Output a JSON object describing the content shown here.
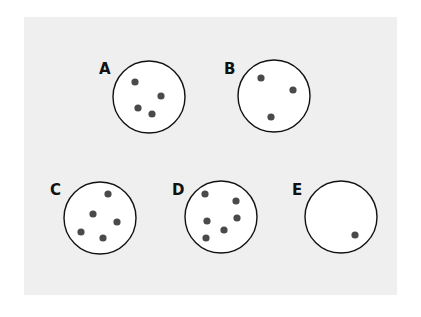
{
  "figure": {
    "background_color": "#efefef",
    "circle_fill": "#ffffff",
    "circle_stroke": "#111111",
    "dot_color": "#4a4a4a",
    "containers": [
      {
        "label": "A",
        "label_pos": [
          99,
          62
        ],
        "center": [
          149,
          97
        ],
        "radius": 36,
        "dots": [
          [
            135,
            82
          ],
          [
            161,
            96
          ],
          [
            138,
            108
          ],
          [
            152,
            114
          ]
        ]
      },
      {
        "label": "B",
        "label_pos": [
          224,
          62
        ],
        "center": [
          274,
          96
        ],
        "radius": 36,
        "dots": [
          [
            261,
            78
          ],
          [
            293,
            90
          ],
          [
            271,
            117
          ]
        ]
      },
      {
        "label": "C",
        "label_pos": [
          50,
          183
        ],
        "center": [
          100,
          218
        ],
        "radius": 36,
        "dots": [
          [
            108,
            194
          ],
          [
            93,
            214
          ],
          [
            117,
            222
          ],
          [
            81,
            232
          ],
          [
            103,
            238
          ]
        ]
      },
      {
        "label": "D",
        "label_pos": [
          172,
          183
        ],
        "center": [
          221,
          217
        ],
        "radius": 36,
        "dots": [
          [
            205,
            194
          ],
          [
            236,
            201
          ],
          [
            207,
            221
          ],
          [
            237,
            218
          ],
          [
            224,
            230
          ],
          [
            206,
            238
          ]
        ]
      },
      {
        "label": "E",
        "label_pos": [
          292,
          183
        ],
        "center": [
          341,
          217
        ],
        "radius": 36,
        "dots": [
          [
            355,
            235
          ]
        ]
      }
    ]
  }
}
